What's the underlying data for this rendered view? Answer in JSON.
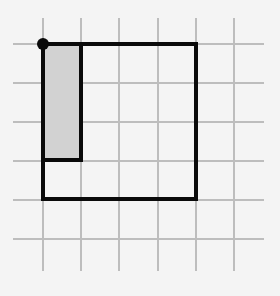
{
  "diagram": {
    "colors": {
      "background": "#f4f4f4",
      "grid": "#bdbdbd",
      "outline": "#0a0a0a",
      "shade": "#d2d2d2",
      "dot": "#0a0a0a"
    },
    "grid": {
      "x_lines": [
        43,
        81,
        119,
        158,
        196,
        234
      ],
      "y_lines": [
        44,
        83,
        122,
        161,
        200,
        239
      ],
      "x_extent": [
        13,
        264
      ],
      "y_extent": [
        18,
        271
      ],
      "cell_size": 38.6
    },
    "outer_square": {
      "x": 43,
      "y": 44,
      "width": 153,
      "height": 155,
      "cells_wide": 4,
      "cells_tall": 4
    },
    "shaded_rect": {
      "x": 43,
      "y": 44,
      "width": 38,
      "height": 116,
      "cells_wide": 1,
      "cells_tall": 3
    },
    "corner_dot": {
      "cx": 43,
      "cy": 44,
      "r": 6
    }
  }
}
